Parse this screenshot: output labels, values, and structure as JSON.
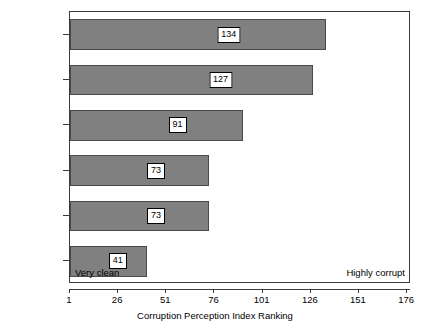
{
  "chart_data": {
    "type": "bar",
    "orientation": "horizontal",
    "title": "",
    "xlabel": "Corruption Perception Index Ranking",
    "ylabel": "",
    "categories": [
      "Honduras",
      "Nicaragua",
      "Guatemala",
      "Panama",
      "El Salvador",
      "Costa Rica"
    ],
    "values": [
      134,
      127,
      91,
      73,
      73,
      41
    ],
    "value_labels": [
      "134",
      "127",
      "91",
      "73",
      "73",
      "41"
    ],
    "xlim": [
      1,
      178
    ],
    "xticks": [
      1,
      26,
      51,
      76,
      101,
      126,
      151,
      176
    ],
    "xtick_labels": [
      "1",
      "26",
      "51",
      "76",
      "101",
      "126",
      "151",
      "176"
    ],
    "grid": false,
    "legend": null,
    "annotations": [
      {
        "text": "Very clean",
        "position": "bottom-left-inside-plot"
      },
      {
        "text": "Highly corrupt",
        "position": "bottom-right-inside-plot"
      }
    ],
    "colors": {
      "bar_fill": "#808080",
      "bar_edge": "#4a4a4a",
      "axis": "#3a3a3a",
      "background": "#ffffff",
      "label_box_fill": "#ffffff",
      "label_box_edge": "#000000"
    }
  }
}
